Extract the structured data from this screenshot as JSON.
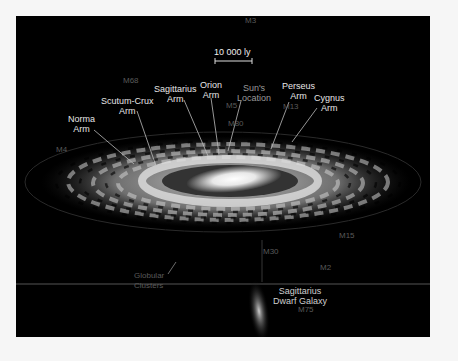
{
  "scale_bar": {
    "label": "10 000 ly"
  },
  "arm_labels": [
    {
      "id": "norma",
      "text": "Norma\nArm"
    },
    {
      "id": "scutum-crux",
      "text": "Scutum-Crux\nArm"
    },
    {
      "id": "sagittarius",
      "text": "Sagittarius\nArm"
    },
    {
      "id": "orion",
      "text": "Orion\nArm"
    },
    {
      "id": "suns-location",
      "text": "Sun's\nLocation"
    },
    {
      "id": "perseus",
      "text": "Perseus\nArm"
    },
    {
      "id": "cygnus",
      "text": "Cygnus\nArm"
    }
  ],
  "cluster_labels": {
    "m3": "M3",
    "m68": "M68",
    "m5": "M5",
    "m80": "M80",
    "m13": "M13",
    "m4": "M4",
    "m15": "M15",
    "m30": "M30",
    "m2": "M2",
    "m75": "M75",
    "globular": "Globular\nClusters"
  },
  "dwarf_galaxy": {
    "label": "Sagittarius\nDwarf Galaxy"
  },
  "colors": {
    "background": "#000000",
    "border": "#f6f6f6",
    "text": "#e6e6e6",
    "faint_text": "#5a5a5a"
  }
}
